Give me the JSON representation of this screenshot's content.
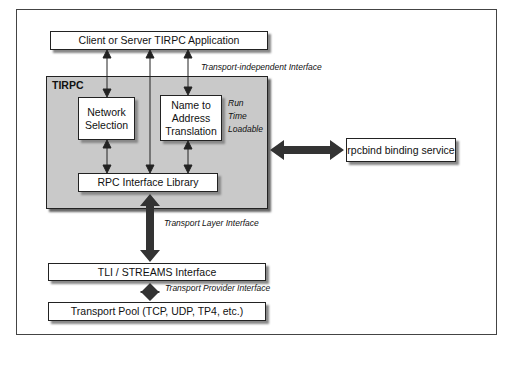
{
  "diagram": {
    "boxes": {
      "application": "Client or Server TIRPC Application",
      "tirpc_group": "TIRPC",
      "network_selection": "Network Selection",
      "name_to_address": "Name to Address Translation",
      "rpc_library": "RPC Interface Library",
      "rpcbind": "rpcbind binding service",
      "tli_streams": "TLI / STREAMS Interface",
      "transport_pool": "Transport Pool (TCP, UDP, TP4, etc.)"
    },
    "labels": {
      "transport_independent": "Transport-independent Interface",
      "run_time_loadable_1": "Run",
      "run_time_loadable_2": "Time",
      "run_time_loadable_3": "Loadable",
      "transport_layer": "Transport Layer Interface",
      "transport_provider": "Transport Provider Interface"
    },
    "colors": {
      "group_fill": "#c9c9c9",
      "box_fill": "#ffffff",
      "arrow": "#222222"
    }
  }
}
